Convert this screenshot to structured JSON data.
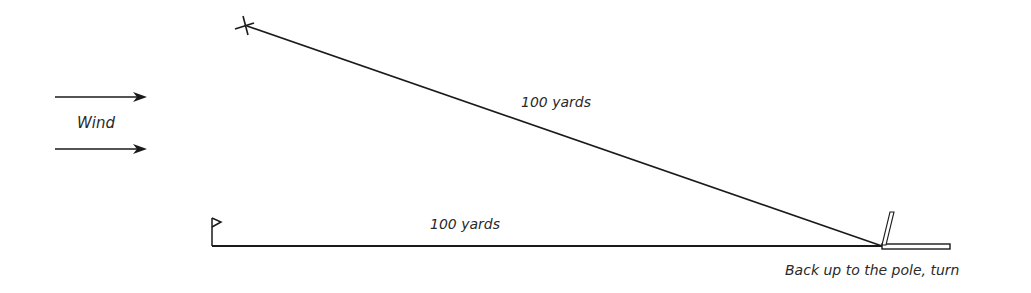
{
  "diagram": {
    "wind_label": "Wind",
    "diagonal_label": "100 yards",
    "baseline_label": "100 yards",
    "pole_label": "Back up to the pole, turn",
    "icons": {
      "wind_arrows": "right-arrow",
      "start_mark": "x-mark",
      "flag": "flag",
      "pole": "pole"
    },
    "colors": {
      "line": "#1a1a1a",
      "text": "#2a2a2a",
      "background": "#ffffff"
    }
  }
}
